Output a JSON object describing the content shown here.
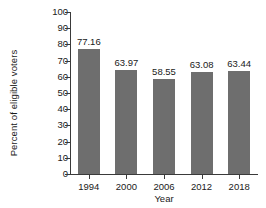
{
  "chart_data": {
    "type": "bar",
    "title": "",
    "subtitle": "",
    "xlabel": "Year",
    "ylabel": "Percent of eligible voters",
    "categories": [
      "1994",
      "2000",
      "2006",
      "2012",
      "2018"
    ],
    "values": [
      77.16,
      63.97,
      58.55,
      63.08,
      63.44
    ],
    "value_labels": [
      "77.16",
      "63.97",
      "58.55",
      "63.08",
      "63.44"
    ],
    "ylim": [
      0,
      100
    ],
    "ytick_labels": [
      "100",
      "90",
      "80",
      "70",
      "60",
      "50",
      "40",
      "30",
      "20",
      "10",
      "0"
    ],
    "ytick_values": [
      100,
      90,
      80,
      70,
      60,
      50,
      40,
      30,
      20,
      10,
      0
    ],
    "grid": false,
    "legend": null,
    "bar_color": "#6e6e6e",
    "axis_color": "#3a3a3a",
    "text_color": "#1a1a1a",
    "background": "#ffffff"
  }
}
